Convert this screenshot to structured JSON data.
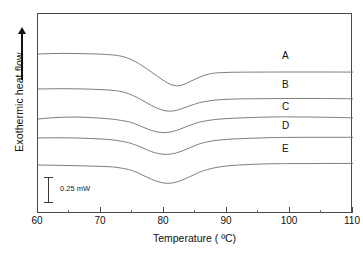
{
  "chart_data": {
    "type": "line",
    "title": "",
    "xlabel": "Temperature ( ºC)",
    "ylabel": "Exothermic heat flow",
    "ylabel_arrow": "up-arrow",
    "xlim": [
      60,
      110
    ],
    "ylim_units": "mW (arbitrary offset)",
    "grid": false,
    "legend_position": "inline-right",
    "x_ticks_major": [
      60,
      70,
      80,
      90,
      100,
      110
    ],
    "x_ticks_minor": [
      65,
      75,
      85,
      95,
      105
    ],
    "x_tick_labels": [
      "60",
      "70",
      "80",
      "90",
      "100",
      "110"
    ],
    "scale_bar": {
      "label": "0.25  mW",
      "value": 0.25,
      "units": "mW"
    },
    "series": [
      {
        "name": "A",
        "label": "A",
        "peak_temperature_c": 81,
        "x": [
          60,
          62,
          64,
          66,
          68,
          70,
          72,
          73,
          74,
          75,
          76,
          77,
          78,
          79,
          80,
          81,
          82,
          83,
          84,
          85,
          86,
          87,
          88,
          90,
          92,
          95,
          100,
          105,
          110
        ],
        "y": [
          53.0,
          52.6,
          52.4,
          52.5,
          52.8,
          53.2,
          54.0,
          54.9,
          56.6,
          59.2,
          62.6,
          66.6,
          71.0,
          75.5,
          79.8,
          83.3,
          84.8,
          83.8,
          81.0,
          78.0,
          75.3,
          73.3,
          72.1,
          71.4,
          71.2,
          71.1,
          71.0,
          71.0,
          71.1
        ]
      },
      {
        "name": "B",
        "label": "B",
        "peak_temperature_c": 81,
        "x": [
          60,
          62,
          64,
          66,
          68,
          70,
          72,
          73,
          74,
          75,
          76,
          77,
          78,
          79,
          80,
          81,
          82,
          83,
          84,
          85,
          86,
          88,
          90,
          92,
          95,
          100,
          105,
          110
        ],
        "y": [
          88.0,
          87.8,
          87.7,
          87.8,
          88.1,
          88.6,
          89.4,
          90.3,
          91.9,
          94.3,
          97.4,
          100.9,
          104.4,
          107.4,
          109.5,
          110.2,
          109.3,
          107.3,
          105.0,
          102.9,
          101.2,
          99.2,
          98.3,
          97.9,
          97.7,
          97.5,
          97.5,
          97.8
        ]
      },
      {
        "name": "C",
        "label": "C",
        "peak_temperature_c": 80,
        "has_low_temp_shoulder": true,
        "x": [
          60,
          62,
          64,
          66,
          68,
          70,
          72,
          74,
          75,
          76,
          77,
          78,
          79,
          80,
          81,
          82,
          83,
          84,
          85,
          86,
          88,
          90,
          92,
          95,
          98,
          100,
          105,
          110
        ],
        "y": [
          118.0,
          116.9,
          116.2,
          116.0,
          116.4,
          117.2,
          118.3,
          120.3,
          121.9,
          124.3,
          127.0,
          129.4,
          131.0,
          131.6,
          131.0,
          129.4,
          127.0,
          124.5,
          122.3,
          120.6,
          118.6,
          117.6,
          117.0,
          116.3,
          115.9,
          115.9,
          116.2,
          116.8
        ]
      },
      {
        "name": "D",
        "label": "D",
        "peak_temperature_c": 81,
        "x": [
          60,
          62,
          64,
          66,
          68,
          70,
          72,
          74,
          75,
          76,
          77,
          78,
          79,
          80,
          81,
          82,
          83,
          84,
          85,
          86,
          88,
          90,
          92,
          95,
          98,
          100,
          105,
          110
        ],
        "y": [
          137.0,
          136.8,
          136.8,
          137.0,
          137.4,
          138.0,
          139.0,
          141.2,
          142.9,
          145.2,
          148.0,
          150.6,
          152.4,
          153.3,
          153.1,
          151.8,
          149.6,
          147.0,
          144.4,
          142.2,
          139.6,
          138.4,
          137.7,
          137.0,
          136.5,
          136.4,
          136.3,
          136.3
        ]
      },
      {
        "name": "E",
        "label": "E",
        "peak_temperature_c": 80,
        "x": [
          60,
          62,
          64,
          66,
          68,
          70,
          72,
          74,
          75,
          76,
          77,
          78,
          79,
          80,
          81,
          82,
          83,
          84,
          85,
          86,
          88,
          90,
          92,
          95,
          98,
          100,
          105,
          110
        ],
        "y": [
          164.0,
          164.2,
          164.4,
          164.7,
          165.0,
          165.4,
          166.0,
          168.0,
          169.7,
          172.3,
          175.3,
          178.2,
          180.6,
          182.0,
          182.2,
          181.0,
          178.8,
          176.0,
          173.0,
          170.3,
          166.8,
          165.0,
          164.0,
          163.1,
          162.7,
          162.6,
          162.5,
          162.4
        ]
      }
    ]
  },
  "axis": {
    "x_title": "Temperature ( ºC)",
    "y_title": "Exothermic heat flow",
    "x_labels": [
      "60",
      "70",
      "80",
      "90",
      "100",
      "110"
    ]
  },
  "scalebar": {
    "text": "0.25  mW"
  },
  "series_labels": {
    "a": "A",
    "b": "B",
    "c": "C",
    "d": "D",
    "e": "E"
  },
  "colors": {
    "curve": "#6e6e6e",
    "frame": "#4a4a4a",
    "text": "#111111",
    "background": "#ffffff"
  }
}
